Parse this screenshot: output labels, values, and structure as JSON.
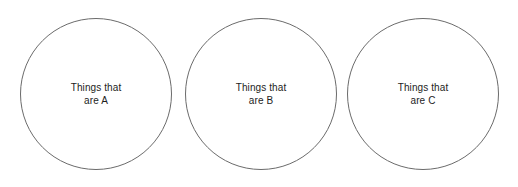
{
  "canvas": {
    "width": 518,
    "height": 187,
    "background_color": "#ffffff"
  },
  "diagram": {
    "type": "three-separate-circles",
    "stroke_color": "#6b6b6b",
    "stroke_width": 1,
    "text_color": "#1d1d1d",
    "circles": [
      {
        "id": "circle-a",
        "label_line_1": "Things that",
        "label_line_2": "are A",
        "center_x": 96,
        "center_y": 94,
        "diameter": 152
      },
      {
        "id": "circle-b",
        "label_line_1": "Things that",
        "label_line_2": "are B",
        "center_x": 261,
        "center_y": 94,
        "diameter": 152
      },
      {
        "id": "circle-c",
        "label_line_1": "Things that",
        "label_line_2": "are C",
        "center_x": 423,
        "center_y": 94,
        "diameter": 152
      }
    ]
  }
}
